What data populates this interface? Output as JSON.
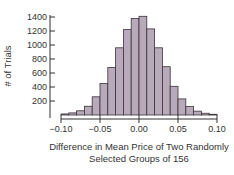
{
  "chart_data": {
    "type": "bar",
    "subtype": "histogram",
    "title": "",
    "xlabel": "Difference in Mean Price of Two Randomly Selected Groups of 156",
    "xlabel_lines": [
      "Difference in Mean Price of Two Randomly",
      "Selected Groups of 156"
    ],
    "ylabel": "# of Trials",
    "bin_width": 0.01,
    "bin_edges": [
      -0.1,
      -0.09,
      -0.08,
      -0.07,
      -0.06,
      -0.05,
      -0.04,
      -0.03,
      -0.02,
      -0.01,
      0.0,
      0.01,
      0.02,
      0.03,
      0.04,
      0.05,
      0.06,
      0.07,
      0.08,
      0.09,
      0.1
    ],
    "values": [
      15,
      30,
      60,
      125,
      260,
      450,
      680,
      960,
      1220,
      1380,
      1410,
      1230,
      960,
      690,
      410,
      230,
      120,
      55,
      25,
      10
    ],
    "xlim": [
      -0.1,
      0.1
    ],
    "ylim": [
      0,
      1450
    ],
    "x_ticks": [
      -0.1,
      -0.05,
      0.0,
      0.05,
      0.1
    ],
    "x_tick_labels": [
      "−0.10",
      "−0.05",
      "0.00",
      "0.05",
      "0.10"
    ],
    "y_ticks": [
      200,
      400,
      600,
      800,
      1000,
      1200,
      1400
    ],
    "y_tick_labels": [
      "200",
      "400",
      "600",
      "800",
      "1000",
      "1200",
      "1400"
    ],
    "grid": false,
    "legend": null,
    "colors": {
      "bar_fill": "#b9aabb",
      "bar_edge": "#3a3338",
      "axis": "#333333"
    }
  }
}
